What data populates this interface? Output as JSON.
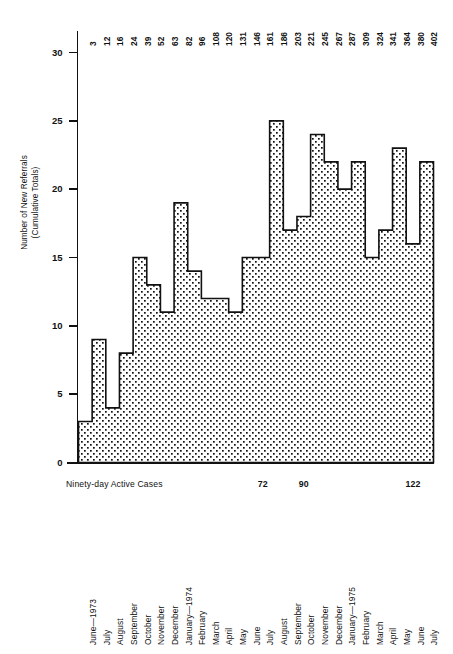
{
  "chart_data": {
    "type": "area",
    "title": "",
    "subtitle": "",
    "ylabel": "Number of New Referrals\n(Cumulative Totals)",
    "xlabel": "",
    "ylim": [
      0,
      31
    ],
    "y_ticks": [
      0,
      5,
      10,
      15,
      20,
      25,
      30
    ],
    "grid": false,
    "legend": "none",
    "note": "Stepped area chart. Each step is one month; the step height is the number of new referrals that month. The figures printed across the top of the plot are the running cumulative totals.",
    "categories": [
      "June—1973",
      "July",
      "August",
      "September",
      "October",
      "November",
      "December",
      "January—1974",
      "February",
      "March",
      "April",
      "May",
      "June",
      "July",
      "August",
      "September",
      "October",
      "November",
      "December",
      "January—1975",
      "February",
      "March",
      "April",
      "May",
      "June",
      "July"
    ],
    "values": [
      3,
      9,
      4,
      8,
      15,
      13,
      11,
      19,
      14,
      12,
      12,
      11,
      15,
      15,
      25,
      17,
      18,
      24,
      22,
      20,
      22,
      15,
      17,
      23,
      16,
      22
    ],
    "cumulative_totals": [
      3,
      12,
      16,
      24,
      39,
      52,
      63,
      82,
      96,
      108,
      120,
      131,
      146,
      161,
      186,
      203,
      221,
      245,
      267,
      287,
      309,
      324,
      341,
      364,
      380,
      402
    ],
    "annotations": {
      "caption": "Ninety-day Active Cases",
      "markers": [
        {
          "label": "72",
          "x_index": 13
        },
        {
          "label": "90",
          "x_index": 16
        },
        {
          "label": "122",
          "x_index": 24
        }
      ]
    },
    "colors": {
      "axis": "#111111",
      "line": "#111111",
      "fill_dots": "#111111",
      "background": "#ffffff"
    }
  }
}
